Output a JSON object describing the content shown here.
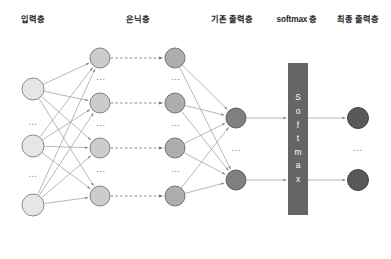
{
  "diagram": {
    "canvas": {
      "width": 391,
      "height": 259,
      "background": "#ffffff"
    },
    "labels": [
      {
        "id": "input-layer",
        "text": "입력층",
        "x": 33,
        "y": 22
      },
      {
        "id": "hidden-layer",
        "text": "은닉층",
        "x": 138,
        "y": 22
      },
      {
        "id": "legacy-output-layer",
        "text": "기존 출력층",
        "x": 232,
        "y": 22
      },
      {
        "id": "softmax-layer",
        "text": "softmax 층",
        "x": 297,
        "y": 22
      },
      {
        "id": "final-output-layer",
        "text": "최종 출력층",
        "x": 358,
        "y": 22
      }
    ],
    "columns": [
      {
        "id": "input",
        "label": "입력층",
        "x": 33,
        "node_radius": 11.5,
        "style": "node-input",
        "nodes_y": [
          89,
          146,
          205
        ],
        "ellipses": [
          {
            "kind": "h",
            "glyph": "⋯",
            "x": 33,
            "y": 124
          },
          {
            "kind": "h",
            "glyph": "⋯",
            "x": 33,
            "y": 176
          }
        ]
      },
      {
        "id": "hidden-a",
        "label": "은닉층",
        "x": 100,
        "node_radius": 10.5,
        "style": "node-hidden-a",
        "nodes_y": [
          58,
          103,
          148,
          196
        ],
        "ellipses": [
          {
            "kind": "v",
            "glyph": "⋮",
            "x": 100,
            "y": 80
          },
          {
            "kind": "v",
            "glyph": "⋮",
            "x": 100,
            "y": 126
          },
          {
            "kind": "v",
            "glyph": "⋮",
            "x": 100,
            "y": 172
          }
        ]
      },
      {
        "id": "hidden-b",
        "label": "은닉층",
        "x": 175,
        "node_radius": 10.5,
        "style": "node-hidden-b",
        "nodes_y": [
          58,
          103,
          148,
          196
        ],
        "ellipses": [
          {
            "kind": "v",
            "glyph": "⋮",
            "x": 175,
            "y": 80
          },
          {
            "kind": "v",
            "glyph": "⋮",
            "x": 175,
            "y": 126
          },
          {
            "kind": "v",
            "glyph": "⋮",
            "x": 175,
            "y": 172
          }
        ]
      },
      {
        "id": "legacy-output",
        "label": "기존 출력층",
        "x": 236,
        "node_radius": 10.5,
        "style": "node-output",
        "nodes_y": [
          118,
          180
        ],
        "ellipses": [
          {
            "kind": "h",
            "glyph": "⋯",
            "x": 236,
            "y": 150
          }
        ]
      },
      {
        "id": "final-output",
        "label": "최종 출력층",
        "x": 358,
        "node_radius": 11,
        "style": "node-final",
        "nodes_y": [
          118,
          180
        ],
        "ellipses": [
          {
            "kind": "h",
            "glyph": "⋯",
            "x": 358,
            "y": 150
          }
        ]
      }
    ],
    "softmax_box": {
      "text": "Softmax",
      "letters": [
        "S",
        "o",
        "f",
        "t",
        "m",
        "a",
        "x"
      ],
      "x": 288,
      "y": 63,
      "width": 20,
      "height": 152,
      "fill": "#656565",
      "text_color": "#ffffff"
    },
    "edges": {
      "line_color": "#9a9a9a",
      "line_width": 0.7,
      "dashed_color": "#7f7f7f",
      "groups": [
        {
          "id": "input-to-hidden-a",
          "from": "input",
          "to": "hidden-a",
          "style": "solid",
          "fully_connected": true
        },
        {
          "id": "hidden-a-to-hidden-b",
          "from": "hidden-a",
          "to": "hidden-b",
          "style": "dashed",
          "fully_connected": false
        },
        {
          "id": "hidden-b-to-legacy-output",
          "from": "hidden-b",
          "to": "legacy-output",
          "style": "solid",
          "fully_connected": true
        },
        {
          "id": "legacy-output-to-softmax",
          "from": "legacy-output",
          "to": "softmax",
          "style": "solid",
          "fully_connected": false
        },
        {
          "id": "softmax-to-final-output",
          "from": "softmax",
          "to": "final-output",
          "style": "solid",
          "fully_connected": false
        }
      ]
    }
  }
}
